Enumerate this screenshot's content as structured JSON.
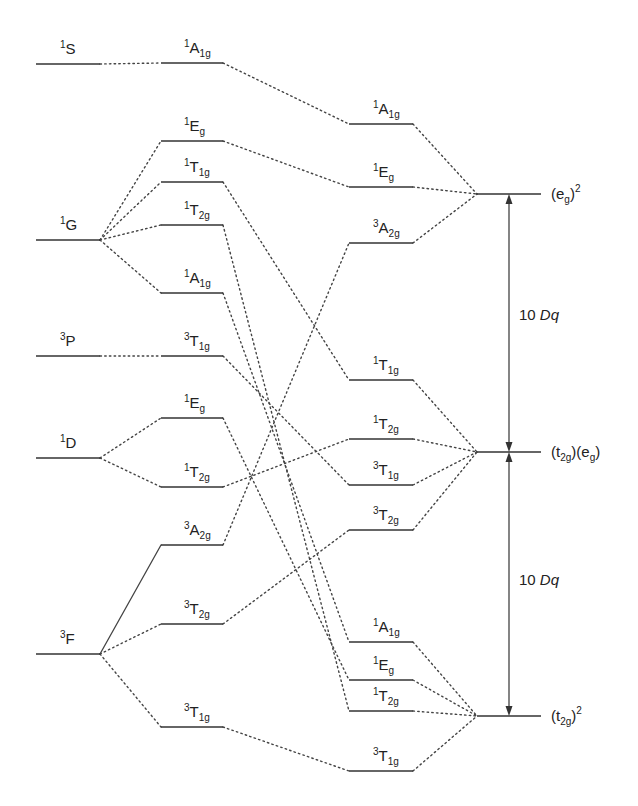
{
  "colors": {
    "line": "#333333",
    "text": "#222222",
    "background": "#ffffff"
  },
  "columns": {
    "free_ion": {
      "x1": 36,
      "x2": 100
    },
    "weak_field": {
      "x1": 161,
      "x2": 223
    },
    "strong_field": {
      "x1": 349,
      "x2": 413
    },
    "configuration": {
      "x1": 477,
      "x2": 541
    }
  },
  "free_ion_terms": [
    {
      "id": "fi_1S",
      "sup": "1",
      "term": "S",
      "sub": "",
      "y": 64
    },
    {
      "id": "fi_1G",
      "sup": "1",
      "term": "G",
      "sub": "",
      "y": 240
    },
    {
      "id": "fi_3P",
      "sup": "3",
      "term": "P",
      "sub": "",
      "y": 356
    },
    {
      "id": "fi_1D",
      "sup": "1",
      "term": "D",
      "sub": "",
      "y": 458
    },
    {
      "id": "fi_3F",
      "sup": "3",
      "term": "F",
      "sub": "",
      "y": 654
    }
  ],
  "weak_field_states": [
    {
      "id": "w_1A1g_S",
      "sup": "1",
      "term": "A",
      "sub": "1g",
      "y": 63
    },
    {
      "id": "w_1Eg_G",
      "sup": "1",
      "term": "E",
      "sub": "g",
      "y": 141
    },
    {
      "id": "w_1T1g_G",
      "sup": "1",
      "term": "T",
      "sub": "1g",
      "y": 182
    },
    {
      "id": "w_1T2g_G",
      "sup": "1",
      "term": "T",
      "sub": "2g",
      "y": 225
    },
    {
      "id": "w_1A1g_G",
      "sup": "1",
      "term": "A",
      "sub": "1g",
      "y": 293
    },
    {
      "id": "w_3T1g_P",
      "sup": "3",
      "term": "T",
      "sub": "1g",
      "y": 356
    },
    {
      "id": "w_1Eg_D",
      "sup": "1",
      "term": "E",
      "sub": "g",
      "y": 418
    },
    {
      "id": "w_1T2g_D",
      "sup": "1",
      "term": "T",
      "sub": "2g",
      "y": 487
    },
    {
      "id": "w_3A2g_F",
      "sup": "3",
      "term": "A",
      "sub": "2g",
      "y": 545
    },
    {
      "id": "w_3T2g_F",
      "sup": "3",
      "term": "T",
      "sub": "2g",
      "y": 624
    },
    {
      "id": "w_3T1g_F",
      "sup": "3",
      "term": "T",
      "sub": "1g",
      "y": 727
    }
  ],
  "strong_field_states": [
    {
      "id": "s_1A1g_a",
      "sup": "1",
      "term": "A",
      "sub": "1g",
      "y": 124
    },
    {
      "id": "s_1Eg_a",
      "sup": "1",
      "term": "E",
      "sub": "g",
      "y": 187
    },
    {
      "id": "s_3A2g",
      "sup": "3",
      "term": "A",
      "sub": "2g",
      "y": 243
    },
    {
      "id": "s_1T1g",
      "sup": "1",
      "term": "T",
      "sub": "1g",
      "y": 380
    },
    {
      "id": "s_1T2g_b",
      "sup": "1",
      "term": "T",
      "sub": "2g",
      "y": 439
    },
    {
      "id": "s_3T1g_b",
      "sup": "3",
      "term": "T",
      "sub": "1g",
      "y": 485
    },
    {
      "id": "s_3T2g",
      "sup": "3",
      "term": "T",
      "sub": "2g",
      "y": 530
    },
    {
      "id": "s_1A1g_c",
      "sup": "1",
      "term": "A",
      "sub": "1g",
      "y": 642
    },
    {
      "id": "s_1Eg_c",
      "sup": "1",
      "term": "E",
      "sub": "g",
      "y": 680
    },
    {
      "id": "s_1T2g_c",
      "sup": "1",
      "term": "T",
      "sub": "2g",
      "y": 711
    },
    {
      "id": "s_3T1g_c",
      "sup": "3",
      "term": "T",
      "sub": "1g",
      "y": 771
    }
  ],
  "configurations": [
    {
      "id": "c_eg2",
      "label_html": "eg2",
      "y": 194,
      "parts": [
        {
          "t": "(e"
        },
        {
          "t": "g",
          "sub": true
        },
        {
          "t": ")"
        },
        {
          "t": "2",
          "sup": true
        }
      ]
    },
    {
      "id": "c_t2geg",
      "y": 452,
      "parts": [
        {
          "t": "(t"
        },
        {
          "t": "2g",
          "sub": true
        },
        {
          "t": ")(e"
        },
        {
          "t": "g",
          "sub": true
        },
        {
          "t": ")"
        }
      ]
    },
    {
      "id": "c_t2g2",
      "y": 716,
      "parts": [
        {
          "t": "(t"
        },
        {
          "t": "2g",
          "sub": true
        },
        {
          "t": ")"
        },
        {
          "t": "2",
          "sup": true
        }
      ]
    }
  ],
  "free_to_weak": [
    [
      "fi_1S",
      "w_1A1g_S"
    ],
    [
      "fi_1G",
      "w_1Eg_G"
    ],
    [
      "fi_1G",
      "w_1T1g_G"
    ],
    [
      "fi_1G",
      "w_1T2g_G"
    ],
    [
      "fi_1G",
      "w_1A1g_G"
    ],
    [
      "fi_3P",
      "w_3T1g_P"
    ],
    [
      "fi_1D",
      "w_1Eg_D"
    ],
    [
      "fi_1D",
      "w_1T2g_D"
    ],
    [
      "fi_3F",
      "w_3T2g_F"
    ],
    [
      "fi_3F",
      "w_3T1g_F"
    ]
  ],
  "free_to_weak_solid": [
    [
      "fi_3F",
      "w_3A2g_F"
    ]
  ],
  "weak_to_strong": [
    [
      "w_1A1g_S",
      "s_1A1g_a"
    ],
    [
      "w_1Eg_G",
      "s_1Eg_a"
    ],
    [
      "w_1T1g_G",
      "s_1T1g"
    ],
    [
      "w_1T2g_G",
      "s_1T2g_c"
    ],
    [
      "w_1A1g_G",
      "s_1A1g_c"
    ],
    [
      "w_3T1g_P",
      "s_3T1g_b"
    ],
    [
      "w_1Eg_D",
      "s_1Eg_c"
    ],
    [
      "w_1T2g_D",
      "s_1T2g_b"
    ],
    [
      "w_3A2g_F",
      "s_3A2g"
    ],
    [
      "w_3T2g_F",
      "s_3T2g"
    ],
    [
      "w_3T1g_F",
      "s_3T1g_c"
    ]
  ],
  "strong_to_config": [
    [
      "s_1A1g_a",
      "c_eg2"
    ],
    [
      "s_1Eg_a",
      "c_eg2"
    ],
    [
      "s_3A2g",
      "c_eg2"
    ],
    [
      "s_1T1g",
      "c_t2geg"
    ],
    [
      "s_1T2g_b",
      "c_t2geg"
    ],
    [
      "s_3T1g_b",
      "c_t2geg"
    ],
    [
      "s_3T2g",
      "c_t2geg"
    ],
    [
      "s_1A1g_c",
      "c_t2g2"
    ],
    [
      "s_1Eg_c",
      "c_t2g2"
    ],
    [
      "s_1T2g_c",
      "c_t2g2"
    ],
    [
      "s_3T1g_c",
      "c_t2g2"
    ]
  ],
  "energy_gaps": [
    {
      "id": "gap_upper",
      "x": 509,
      "y_top": 194,
      "y_bottom": 452,
      "label_num": "10 ",
      "label_var": "Dq",
      "label_y": 320
    },
    {
      "id": "gap_lower",
      "x": 509,
      "y_top": 452,
      "y_bottom": 716,
      "label_num": "10 ",
      "label_var": "Dq",
      "label_y": 585
    }
  ]
}
